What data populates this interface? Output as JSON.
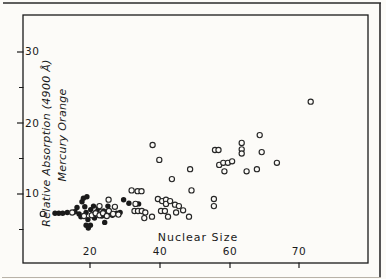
{
  "colors": {
    "ink": "#1a1a1a",
    "paper": "#fcfbf8",
    "page_edge": "#2b2b2b",
    "page_edge_faint": "#b8b2a8"
  },
  "chart_data": {
    "type": "scatter",
    "title": "",
    "xlabel": "Nuclear Size",
    "ylabel_line1": "Relative Absorption (4900 Å)",
    "ylabel_line2": "Mercury Orange",
    "x_tick_labels": [
      "20",
      "40",
      "60",
      "70"
    ],
    "y_tick_labels": [
      "30",
      "20",
      "10"
    ],
    "x_ticks": [
      20,
      40,
      60,
      70
    ],
    "y_ticks": [
      30,
      20,
      10
    ],
    "y_minor_ticks": [
      25,
      15,
      5
    ],
    "xlim": [
      1,
      80
    ],
    "ylim": [
      0,
      35
    ],
    "grid": false,
    "legend": null,
    "series": [
      {
        "name": "filled circles",
        "marker": "filled-circle",
        "color": "#1a1a1a",
        "points": [
          [
            10.0,
            7.3
          ],
          [
            11.1,
            7.3
          ],
          [
            12.2,
            7.3
          ],
          [
            13.5,
            7.4
          ],
          [
            15.7,
            7.5
          ],
          [
            16.3,
            8.1
          ],
          [
            16.9,
            7.2
          ],
          [
            17.4,
            6.8
          ],
          [
            17.7,
            8.9
          ],
          [
            18.1,
            9.4
          ],
          [
            18.5,
            8.2
          ],
          [
            18.9,
            7.4
          ],
          [
            19.1,
            9.6
          ],
          [
            18.9,
            5.6
          ],
          [
            19.5,
            5.2
          ],
          [
            20.1,
            5.6
          ],
          [
            19.4,
            6.4
          ],
          [
            20.2,
            7.8
          ],
          [
            20.6,
            7.1
          ],
          [
            21.0,
            8.3
          ],
          [
            21.3,
            6.6
          ],
          [
            21.9,
            7.5
          ],
          [
            22.4,
            8.0
          ],
          [
            22.9,
            7.2
          ],
          [
            23.4,
            6.9
          ],
          [
            23.9,
            7.6
          ],
          [
            24.2,
            6.0
          ],
          [
            24.5,
            7.2
          ],
          [
            25.1,
            8.3
          ],
          [
            25.7,
            7.4
          ],
          [
            26.4,
            7.0
          ],
          [
            27.6,
            7.3
          ],
          [
            28.6,
            7.4
          ],
          [
            29.6,
            9.2
          ],
          [
            31.1,
            8.7
          ],
          [
            33.9,
            8.6
          ]
        ]
      },
      {
        "name": "open circles",
        "marker": "open-circle",
        "color": "#262626",
        "points": [
          [
            6.5,
            7.2
          ],
          [
            14.9,
            7.4
          ],
          [
            18.3,
            6.9
          ],
          [
            20.5,
            7.0
          ],
          [
            21.6,
            7.3
          ],
          [
            22.7,
            7.0
          ],
          [
            23.7,
            7.3
          ],
          [
            24.8,
            6.9
          ],
          [
            25.4,
            7.6
          ],
          [
            26.6,
            7.2
          ],
          [
            28.1,
            7.1
          ],
          [
            22.7,
            8.3
          ],
          [
            25.3,
            9.2
          ],
          [
            27.1,
            8.2
          ],
          [
            31.9,
            10.5
          ],
          [
            33.6,
            10.4
          ],
          [
            34.7,
            10.4
          ],
          [
            33.0,
            8.6
          ],
          [
            32.7,
            7.6
          ],
          [
            33.7,
            7.6
          ],
          [
            34.8,
            7.6
          ],
          [
            35.8,
            7.4
          ],
          [
            35.5,
            6.6
          ],
          [
            37.7,
            6.8
          ],
          [
            39.4,
            9.3
          ],
          [
            40.6,
            9.0
          ],
          [
            41.7,
            9.2
          ],
          [
            41.7,
            8.6
          ],
          [
            42.9,
            9.0
          ],
          [
            44.3,
            8.5
          ],
          [
            45.4,
            8.3
          ],
          [
            40.3,
            7.6
          ],
          [
            41.4,
            7.6
          ],
          [
            44.6,
            7.4
          ],
          [
            42.3,
            6.8
          ],
          [
            46.6,
            7.7
          ],
          [
            48.3,
            6.8
          ],
          [
            49.0,
            10.5
          ],
          [
            43.4,
            12.1
          ],
          [
            48.6,
            13.5
          ],
          [
            37.9,
            16.9
          ],
          [
            39.8,
            14.8
          ],
          [
            55.4,
            9.3
          ],
          [
            55.4,
            8.3
          ],
          [
            55.7,
            16.2
          ],
          [
            56.7,
            16.2
          ],
          [
            61.7,
            17.2
          ],
          [
            61.7,
            16.3
          ],
          [
            61.7,
            15.7
          ],
          [
            64.3,
            18.3
          ],
          [
            64.6,
            15.9
          ],
          [
            56.9,
            14.1
          ],
          [
            58.1,
            14.4
          ],
          [
            59.4,
            14.4
          ],
          [
            60.3,
            14.6
          ],
          [
            58.4,
            13.2
          ],
          [
            62.4,
            13.2
          ],
          [
            63.9,
            13.5
          ],
          [
            66.8,
            14.4
          ],
          [
            71.7,
            23.0
          ]
        ]
      }
    ],
    "layout": {
      "plot_frame_px": {
        "left": 23,
        "top": 15,
        "right": 368,
        "bottom": 263
      },
      "x_axis_px": {
        "value20_at": 90,
        "px_per_unit_below60": 3.5,
        "value60_at": 230,
        "px_per_unit_above60": 6.9
      },
      "y_axis_px": {
        "value10_at": 194,
        "px_per_unit": 7.1
      },
      "tick_labels_inside_frame": true
    }
  }
}
